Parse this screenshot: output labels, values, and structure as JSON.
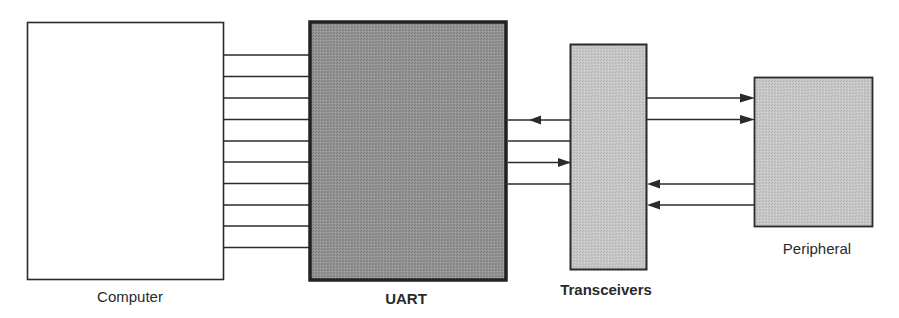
{
  "diagram": {
    "type": "block-diagram",
    "colors": {
      "background": "#ffffff",
      "line": "#2b2b2b",
      "computer_fill": "#ffffff",
      "uart_fill": "#8f8f8f",
      "transceivers_fill": "#c4c4c4",
      "peripheral_fill": "#c8c8c8"
    },
    "blocks": [
      {
        "id": "computer",
        "label": "Computer",
        "bold": false
      },
      {
        "id": "uart",
        "label": "UART",
        "bold": true
      },
      {
        "id": "transceivers",
        "label": "Transceivers",
        "bold": true
      },
      {
        "id": "peripheral",
        "label": "Peripheral",
        "bold": false
      }
    ],
    "connections": [
      {
        "from": "computer",
        "to": "uart",
        "count": 10,
        "direction": "none",
        "type": "parallel-bus"
      },
      {
        "from": "transceivers",
        "to": "uart",
        "count": 1,
        "direction": "arrow-to-uart"
      },
      {
        "from": "uart",
        "to": "transceivers",
        "count": 1,
        "direction": "none"
      },
      {
        "from": "uart",
        "to": "transceivers",
        "count": 1,
        "direction": "arrow-to-transceivers"
      },
      {
        "from": "uart",
        "to": "transceivers",
        "count": 1,
        "direction": "none"
      },
      {
        "from": "transceivers",
        "to": "peripheral",
        "count": 2,
        "direction": "arrow-to-peripheral"
      },
      {
        "from": "peripheral",
        "to": "transceivers",
        "count": 2,
        "direction": "arrow-to-transceivers"
      }
    ]
  },
  "labels": {
    "computer": "Computer",
    "uart": "UART",
    "transceivers": "Transceivers",
    "peripheral": "Peripheral"
  }
}
